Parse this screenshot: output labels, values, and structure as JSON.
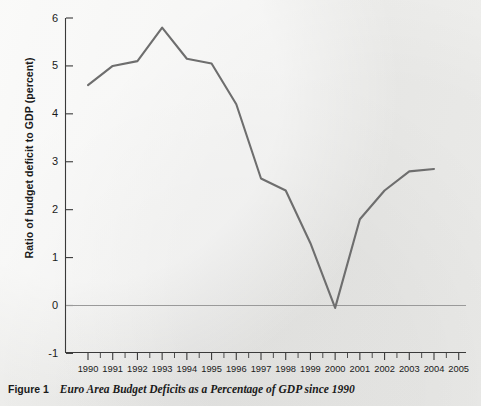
{
  "figure": {
    "number_label": "Figure 1",
    "caption_title": "Euro Area Budget Deficits as a Percentage of GDP since 1990"
  },
  "axes": {
    "ylabel": "Ratio of budget deficit to GDP (percent)",
    "xlabel": "",
    "ytick_labels": [
      "6",
      "5",
      "4",
      "3",
      "2",
      "1",
      "0",
      "-1"
    ],
    "xtick_labels": [
      "1990",
      "1991",
      "1992",
      "1993",
      "1994",
      "1995",
      "1996",
      "1997",
      "1998",
      "1999",
      "2000",
      "2001",
      "2002",
      "2003",
      "2004",
      "2005"
    ]
  },
  "colors": {
    "background": "#eeeeec",
    "line": "#6e6e6e",
    "axis": "#3a3a3a",
    "zero_line": "#9a9a9a",
    "text": "#1a1a1a"
  },
  "chart_data": {
    "type": "line",
    "title": "Euro Area Budget Deficits as a Percentage of GDP since 1990",
    "xlabel": "",
    "ylabel": "Ratio of budget deficit to GDP (percent)",
    "xlim": [
      1990,
      2005
    ],
    "ylim": [
      -1,
      6
    ],
    "ytick_step": 1,
    "grid": false,
    "legend": false,
    "zero_reference_line": true,
    "x": [
      1990,
      1991,
      1992,
      1993,
      1994,
      1995,
      1996,
      1997,
      1998,
      1999,
      2000,
      2001,
      2002,
      2003,
      2004
    ],
    "series": [
      {
        "name": "Euro area budget deficit (% of GDP)",
        "values": [
          4.6,
          5.0,
          5.1,
          5.8,
          5.15,
          5.05,
          4.2,
          2.65,
          2.4,
          1.3,
          -0.05,
          1.8,
          2.4,
          2.8,
          2.85
        ]
      }
    ],
    "annotations": {
      "peak": {
        "year": 1993,
        "value": 5.8
      },
      "trough": {
        "year": 2000,
        "value": -0.05
      }
    }
  }
}
